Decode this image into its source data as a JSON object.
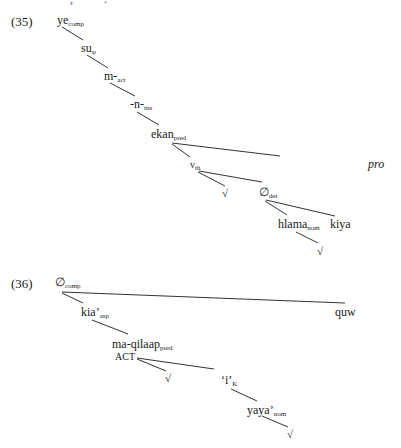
{
  "top_clip": {
    "left": ",",
    "right": "."
  },
  "example_35": {
    "number": "(35)",
    "nodes": {
      "ye": {
        "base": "ye",
        "sub": "comp"
      },
      "su": {
        "base": "su",
        "sub": "φ"
      },
      "m": {
        "base": "m-",
        "sub": "act"
      },
      "n": {
        "base": "-n-",
        "sub": "ins"
      },
      "ekan": {
        "base": "ekan",
        "sub": "pred"
      },
      "pro": {
        "base": "pro"
      },
      "v": {
        "base": "v",
        "sub": "th"
      },
      "root1": {
        "base": "√"
      },
      "det": {
        "base": "∅",
        "sub": "det"
      },
      "hlama": {
        "base": "hlama",
        "sub": "nom"
      },
      "kiya": {
        "base": "kiya"
      },
      "root2": {
        "base": "√"
      }
    }
  },
  "example_36": {
    "number": "(36)",
    "nodes": {
      "comp": {
        "base": "∅",
        "sub": "comp"
      },
      "kia": {
        "base": "kia’",
        "sub": "asp"
      },
      "quw": {
        "base": "quw"
      },
      "maqilaap": {
        "base": "ma-qilaap",
        "sub": "pred"
      },
      "act": {
        "base": "ACT"
      },
      "root1": {
        "base": "√"
      },
      "i": {
        "base": "‘i’",
        "sub": "K"
      },
      "yaya": {
        "base": "yaya’",
        "sub": "nom"
      },
      "root2": {
        "base": "√"
      }
    }
  }
}
